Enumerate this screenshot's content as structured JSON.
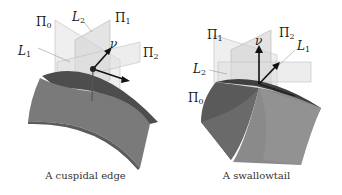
{
  "figures": [
    {
      "id": "cuspidal-edge",
      "caption": "A cuspidal edge",
      "labels": {
        "pi0": {
          "sym": "Π",
          "sub": "0"
        },
        "pi1": {
          "sym": "Π",
          "sub": "1"
        },
        "pi2": {
          "sym": "Π",
          "sub": "2"
        },
        "l1": {
          "sym": "L",
          "sub": "1"
        },
        "l2": {
          "sym": "L",
          "sub": "2"
        },
        "nu": {
          "sym": "ν"
        }
      }
    },
    {
      "id": "swallowtail",
      "caption": "A swallowtail",
      "labels": {
        "pi0": {
          "sym": "Π",
          "sub": "0"
        },
        "pi1": {
          "sym": "Π",
          "sub": "1"
        },
        "pi2": {
          "sym": "Π",
          "sub": "2"
        },
        "l1": {
          "sym": "L",
          "sub": "1"
        },
        "l2": {
          "sym": "L",
          "sub": "2"
        },
        "nu": {
          "sym": "ν"
        }
      }
    }
  ],
  "colors": {
    "surface_dark": "#4a4a4a",
    "surface_mid": "#6e6e6e",
    "surface_light": "#8c8c8c",
    "plane_fill": "#d6d6d6",
    "arrow": "#111111"
  }
}
